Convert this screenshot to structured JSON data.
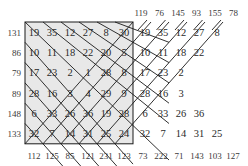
{
  "colors": {
    "grid_fill": "#e8e8e8",
    "line": "#1a1a1a",
    "text": "#2a2a2a"
  },
  "grid": {
    "rows": [
      [
        19,
        35,
        12,
        27,
        8,
        30
      ],
      [
        10,
        11,
        18,
        22,
        20,
        5
      ],
      [
        17,
        23,
        2,
        1,
        28,
        8
      ],
      [
        28,
        16,
        3,
        4,
        29,
        9
      ],
      [
        6,
        33,
        26,
        36,
        19,
        28
      ],
      [
        32,
        7,
        14,
        31,
        25,
        24
      ]
    ],
    "row_sums": [
      131,
      86,
      79,
      89,
      148,
      133
    ],
    "bottom_labels_left": [
      112,
      125,
      85,
      121,
      231,
      123
    ],
    "bottom_labels_right": [
      73,
      222,
      71,
      143,
      103,
      127
    ],
    "top_labels_right": [
      119,
      76,
      145,
      93,
      155,
      78
    ]
  },
  "right_upper": [
    [
      19,
      35,
      12,
      27,
      8
    ],
    [
      10,
      11,
      18,
      22
    ],
    [
      17,
      23,
      2
    ],
    [
      28,
      16,
      3
    ]
  ],
  "right_lower": [
    [
      6,
      33,
      26,
      36
    ],
    [
      32,
      7,
      14,
      31,
      25
    ]
  ]
}
